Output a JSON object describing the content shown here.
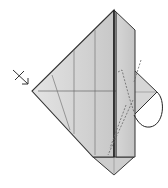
{
  "diagram": {
    "type": "origami-step",
    "colors": {
      "background": "#ffffff",
      "paper_light": "#dcdcdc",
      "paper_mid": "#cfcfcf",
      "paper_dark": "#bdbdbd",
      "outline": "#333333",
      "crease": "#707070",
      "dashed": "#666666"
    },
    "symbols": [
      {
        "name": "turn-over-arrow",
        "position": "left"
      },
      {
        "name": "fold-behind-loop-arrow",
        "position": "right"
      }
    ]
  }
}
